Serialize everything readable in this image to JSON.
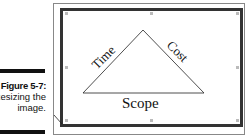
{
  "caption": {
    "figure_label": "Figure 5-7:",
    "line2": "Resizing the",
    "line3": "image."
  },
  "figure": {
    "labels": {
      "left": "Time",
      "right": "Cost",
      "bottom": "Scope"
    },
    "frame_color": "#333333"
  }
}
